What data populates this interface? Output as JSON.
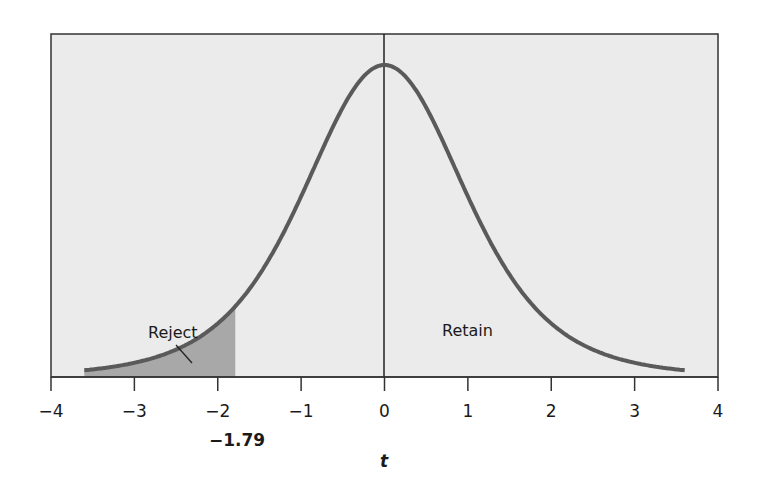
{
  "chart_data": {
    "type": "area",
    "title": "",
    "xlabel": "t",
    "ylabel": "",
    "xlim": [
      -4,
      4
    ],
    "x_ticks": [
      -4,
      -3,
      -2,
      -1,
      0,
      1,
      2,
      3,
      4
    ],
    "x_tick_labels": [
      "−4",
      "−3",
      "−2",
      "−1",
      "0",
      "1",
      "2",
      "3",
      "4"
    ],
    "curve": "t-distribution density (bell curve) centered at 0, drawn from about -3.6 to 3.6",
    "critical_value": -1.79,
    "critical_value_label": "−1.79",
    "regions": [
      {
        "name": "Reject",
        "from": -3.6,
        "to": -1.79,
        "shaded": true
      },
      {
        "name": "Retain",
        "from": -1.79,
        "to": 3.6,
        "shaded": false
      }
    ],
    "grid": false,
    "legend": "none",
    "colors": {
      "background": "#ebebeb",
      "curve": "#5a5a5a",
      "reject_fill": "#a8a8a8",
      "frame": "#333333"
    }
  },
  "labels": {
    "reject": "Reject",
    "retain": "Retain",
    "critical": "−1.79",
    "axis": "t"
  }
}
